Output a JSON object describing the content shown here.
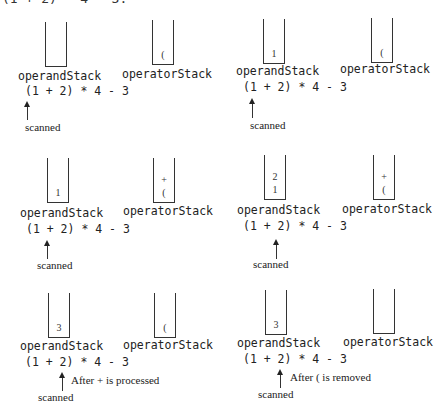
{
  "top_caption": "(1 + 2) * 4 - 3.",
  "labels": {
    "operand": "operandStack",
    "operator": "operatorStack"
  },
  "expression": "(1 + 2) * 4 - 3",
  "scanned_label": "scanned",
  "panels": [
    {
      "operand_items": [],
      "operator_items": [
        "("
      ],
      "note": ""
    },
    {
      "operand_items": [
        "1"
      ],
      "operator_items": [
        "("
      ],
      "note": ""
    },
    {
      "operand_items": [
        "1"
      ],
      "operator_items": [
        "+",
        "("
      ],
      "note": ""
    },
    {
      "operand_items": [
        "2",
        "1"
      ],
      "operator_items": [
        "+",
        "("
      ],
      "note": ""
    },
    {
      "operand_items": [
        "3"
      ],
      "operator_items": [
        "("
      ],
      "note": "After + is processed"
    },
    {
      "operand_items": [
        "3"
      ],
      "operator_items": [],
      "note": "After ( is removed"
    }
  ]
}
